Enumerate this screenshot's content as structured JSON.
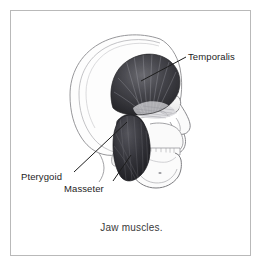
{
  "figure": {
    "caption": "Jaw muscles.",
    "frame": {
      "border_color": "#b9b9b9",
      "background_color": "#ffffff"
    },
    "labels": [
      {
        "id": "temporalis",
        "text": "Temporalis",
        "name": "label-temporalis",
        "leader_from": [
          186,
          57
        ],
        "leader_to": [
          141,
          81
        ]
      },
      {
        "id": "pterygoid",
        "text": "Pterygoid",
        "name": "label-pterygoid",
        "leader_from": [
          74,
          172
        ],
        "leader_to": [
          125,
          122
        ]
      },
      {
        "id": "masseter",
        "text": "Masseter",
        "name": "label-masseter",
        "leader_from": [
          113,
          181
        ],
        "leader_to": [
          131,
          155
        ]
      }
    ],
    "colors": {
      "muscle_dark": "#2f2f33",
      "muscle_mid": "#55555c",
      "bone_outline": "#6f6f73",
      "bone_fill": "#fbfbfb",
      "bone_shade": "#dedede",
      "leader_line": "#1d1d1d",
      "label_text": "#1d1d1d",
      "caption_text": "#3a3a3a"
    }
  }
}
